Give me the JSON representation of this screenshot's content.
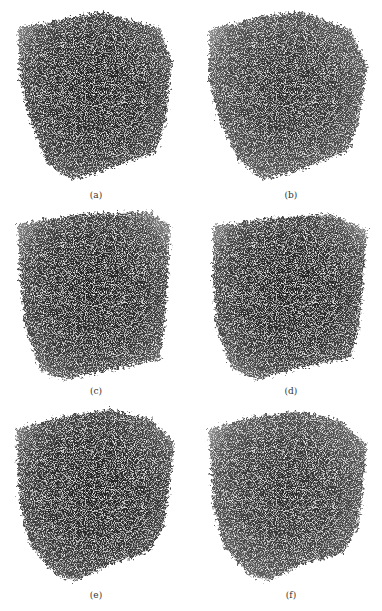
{
  "figure": {
    "layout": {
      "rows": 3,
      "cols": 2
    },
    "panels": [
      {
        "id": "a",
        "caption": "(a)",
        "view": "3D porous cube rendering, oblique view, dense dark core"
      },
      {
        "id": "b",
        "caption": "(b)",
        "view": "3D porous cube rendering, oblique view, slightly lighter edges"
      },
      {
        "id": "c",
        "caption": "(c)",
        "view": "3D porous cube rendering, near-frontal view"
      },
      {
        "id": "d",
        "caption": "(d)",
        "view": "3D porous cube rendering, near-frontal view"
      },
      {
        "id": "e",
        "caption": "(e)",
        "view": "3D porous cube rendering, corner-on view"
      },
      {
        "id": "f",
        "caption": "(f)",
        "view": "3D porous cube rendering, corner-on view, lighter speckle"
      }
    ],
    "colors": {
      "background": "#ffffff",
      "particles_dark": "#2a2a2a",
      "particles_mid": "#555555",
      "caption_text": "#333333"
    }
  }
}
